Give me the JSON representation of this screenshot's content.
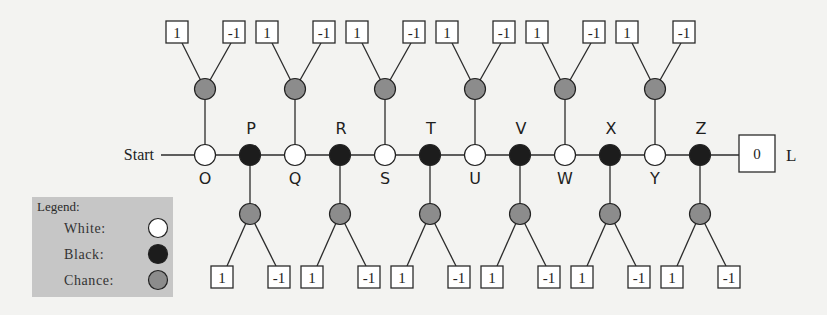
{
  "diagram": {
    "start_label": "Start",
    "terminal": {
      "value": "0",
      "label": "L"
    },
    "main_nodes": [
      {
        "label": "O",
        "type": "white",
        "label_pos": "below",
        "chance": {
          "direction": "up",
          "outcomes": [
            "1",
            "-1"
          ]
        }
      },
      {
        "label": "P",
        "type": "black",
        "label_pos": "above",
        "chance": {
          "direction": "down",
          "outcomes": [
            "1",
            "-1"
          ]
        }
      },
      {
        "label": "Q",
        "type": "white",
        "label_pos": "below",
        "chance": {
          "direction": "up",
          "outcomes": [
            "1",
            "-1"
          ]
        }
      },
      {
        "label": "R",
        "type": "black",
        "label_pos": "above",
        "chance": {
          "direction": "down",
          "outcomes": [
            "1",
            "-1"
          ]
        }
      },
      {
        "label": "S",
        "type": "white",
        "label_pos": "below",
        "chance": {
          "direction": "up",
          "outcomes": [
            "1",
            "-1"
          ]
        }
      },
      {
        "label": "T",
        "type": "black",
        "label_pos": "above",
        "chance": {
          "direction": "down",
          "outcomes": [
            "1",
            "-1"
          ]
        }
      },
      {
        "label": "U",
        "type": "white",
        "label_pos": "below",
        "chance": {
          "direction": "up",
          "outcomes": [
            "1",
            "-1"
          ]
        }
      },
      {
        "label": "V",
        "type": "black",
        "label_pos": "above",
        "chance": {
          "direction": "down",
          "outcomes": [
            "1",
            "-1"
          ]
        }
      },
      {
        "label": "W",
        "type": "white",
        "label_pos": "below",
        "chance": {
          "direction": "up",
          "outcomes": [
            "1",
            "-1"
          ]
        }
      },
      {
        "label": "X",
        "type": "black",
        "label_pos": "above",
        "chance": {
          "direction": "down",
          "outcomes": [
            "1",
            "-1"
          ]
        }
      },
      {
        "label": "Y",
        "type": "white",
        "label_pos": "below",
        "chance": {
          "direction": "up",
          "outcomes": [
            "1",
            "-1"
          ]
        }
      },
      {
        "label": "Z",
        "type": "black",
        "label_pos": "above",
        "chance": {
          "direction": "down",
          "outcomes": [
            "1",
            "-1"
          ]
        }
      }
    ]
  },
  "legend": {
    "title": "Legend:",
    "items": [
      {
        "label": "White:",
        "type": "white"
      },
      {
        "label": "Black:",
        "type": "black"
      },
      {
        "label": "Chance:",
        "type": "chance"
      }
    ]
  },
  "colors": {
    "white": "#ffffff",
    "black": "#1c1c1c",
    "chance": "#8c8c8c",
    "legend_bg": "#c6c6c6",
    "background": "#f3f3f1"
  }
}
